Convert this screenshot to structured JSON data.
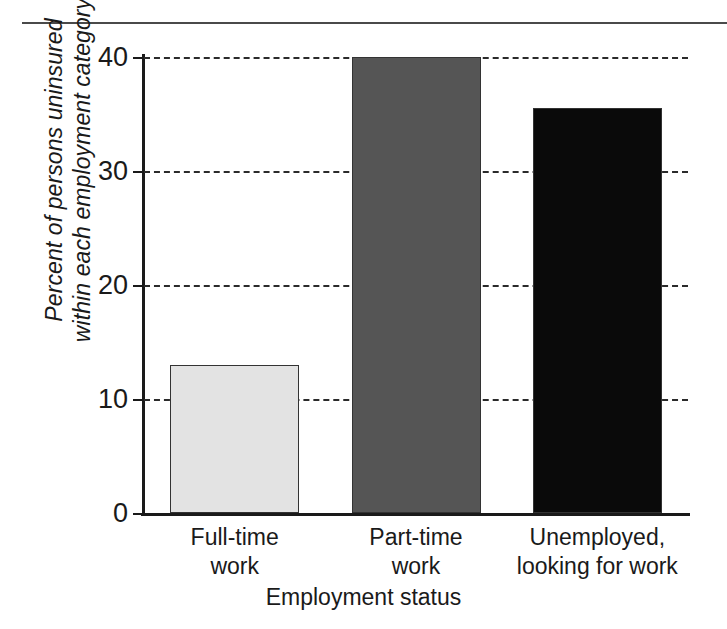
{
  "figure": {
    "top_rule": true,
    "background": "#ffffff"
  },
  "chart_data": {
    "type": "bar",
    "title": "",
    "xlabel": "Employment status",
    "ylabel": "Percent of persons uninsured\nwithin each employment category",
    "categories": [
      "Full-time\nwork",
      "Part-time\nwork",
      "Unemployed,\nlooking for work"
    ],
    "category_names": [
      "Full-time work",
      "Part-time work",
      "Unemployed, looking for work"
    ],
    "values": [
      13,
      40,
      35.5
    ],
    "ylim": [
      0,
      40
    ],
    "yticks": [
      0,
      10,
      20,
      30,
      40
    ],
    "ytick_labels": [
      "0",
      "10",
      "20",
      "30",
      "40"
    ],
    "grid": "horizontal-dashed",
    "legend": "none",
    "bar_colors": [
      "#e3e3e3",
      "#555555",
      "#0a0a0a"
    ],
    "bar_edge_color": "#333333"
  }
}
